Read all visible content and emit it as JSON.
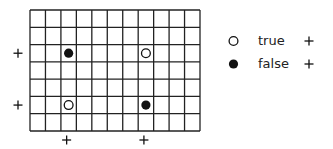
{
  "grid": {
    "columns": 11,
    "rows": 7,
    "left": 30,
    "top": 10,
    "width": 170,
    "height": 121,
    "line_color": "#222222"
  },
  "markers": [
    {
      "type": "filled",
      "col": 2,
      "row": 2,
      "value": "false"
    },
    {
      "type": "open",
      "col": 7,
      "row": 2,
      "value": "true"
    },
    {
      "type": "open",
      "col": 2,
      "row": 5,
      "value": "true"
    },
    {
      "type": "filled",
      "col": 7,
      "row": 5,
      "value": "false"
    }
  ],
  "row_plus_markers": [
    2,
    5
  ],
  "col_plus_markers": [
    2,
    7
  ],
  "plus_symbol": "+",
  "legend": [
    {
      "symbol": "open-circle",
      "label": "true",
      "plus": "+"
    },
    {
      "symbol": "filled-circle",
      "label": "false",
      "plus": "+"
    }
  ]
}
